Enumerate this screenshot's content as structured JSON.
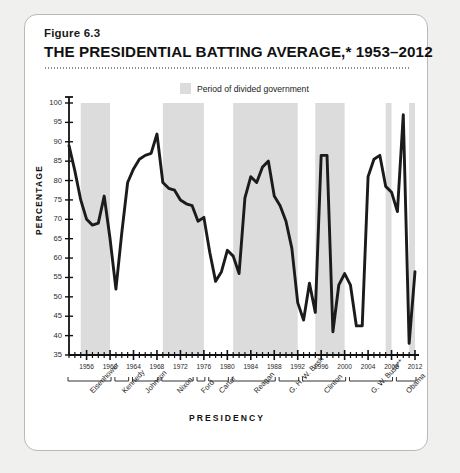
{
  "figure": {
    "number": "Figure 6.3",
    "title": "THE PRESIDENTIAL BATTING AVERAGE,* 1953–2012"
  },
  "legend": {
    "label": "Period of divided government",
    "swatch_color": "#dcdcdc"
  },
  "axes": {
    "y_title": "PERCENTAGE",
    "x_title": "PRESIDENCY",
    "y_ticks": [
      "100",
      "95",
      "90",
      "85",
      "80",
      "75",
      "70",
      "65",
      "60",
      "55",
      "50",
      "45",
      "40",
      "35"
    ],
    "x_ticks": [
      "1956",
      "1960",
      "1964",
      "1968",
      "1972",
      "1976",
      "1980",
      "1984",
      "1988",
      "1992",
      "1996",
      "2000",
      "2004",
      "2008",
      "2012"
    ]
  },
  "presidents": [
    {
      "name": "Eisenhower",
      "start": 1953,
      "end": 1960
    },
    {
      "name": "Kennedy",
      "start": 1961,
      "end": 1963
    },
    {
      "name": "Johnson",
      "start": 1964,
      "end": 1968
    },
    {
      "name": "Nixon",
      "start": 1969,
      "end": 1974
    },
    {
      "name": "Ford",
      "start": 1975,
      "end": 1976
    },
    {
      "name": "Carter",
      "start": 1977,
      "end": 1980
    },
    {
      "name": "Reagan",
      "start": 1981,
      "end": 1988
    },
    {
      "name": "G. H. W. Bush",
      "start": 1989,
      "end": 1992
    },
    {
      "name": "Clinton",
      "start": 1993,
      "end": 2000
    },
    {
      "name": "G. W. Bush**",
      "start": 2001,
      "end": 2008
    },
    {
      "name": "Obama",
      "start": 2009,
      "end": 2012
    }
  ],
  "chart_data": {
    "type": "line",
    "title": "THE PRESIDENTIAL BATTING AVERAGE,* 1953–2012",
    "xlabel": "PRESIDENCY",
    "ylabel": "PERCENTAGE",
    "xlim": [
      1953,
      2012
    ],
    "ylim": [
      35,
      100
    ],
    "grid": false,
    "legend_position": "top-center",
    "line_color": "#1b1b1b",
    "series_name": "Presidential batting average",
    "x": [
      1953,
      1954,
      1955,
      1956,
      1957,
      1958,
      1959,
      1960,
      1961,
      1962,
      1963,
      1964,
      1965,
      1966,
      1967,
      1968,
      1969,
      1970,
      1971,
      1972,
      1973,
      1974,
      1975,
      1976,
      1977,
      1978,
      1979,
      1980,
      1981,
      1982,
      1983,
      1984,
      1985,
      1986,
      1987,
      1988,
      1989,
      1990,
      1991,
      1992,
      1993,
      1994,
      1995,
      1996,
      1997,
      1998,
      1999,
      2000,
      2001,
      2002,
      2003,
      2004,
      2005,
      2006,
      2007,
      2008,
      2009,
      2010,
      2011,
      2012
    ],
    "y": [
      89.0,
      82.5,
      75.0,
      70.0,
      68.5,
      69.0,
      76.0,
      65.0,
      52.0,
      66.5,
      79.5,
      83.0,
      85.5,
      86.5,
      87.0,
      92.0,
      79.5,
      78.0,
      77.5,
      75.0,
      74.0,
      73.5,
      69.5,
      70.5,
      61.5,
      54.0,
      56.5,
      62.0,
      60.5,
      56.0,
      75.5,
      81.0,
      79.5,
      83.5,
      85.0,
      76.0,
      73.5,
      69.5,
      62.5,
      48.5,
      44.0,
      53.5,
      46.0,
      86.5,
      86.5,
      41.0,
      53.0,
      56.0,
      53.0,
      42.5,
      42.5,
      81.0,
      85.5,
      86.5,
      78.5,
      77.0,
      72.0,
      97.0,
      38.0,
      56.5,
      51.0
    ],
    "shaded_bands": [
      {
        "label": "Period of divided government",
        "start": 1955,
        "end": 1960
      },
      {
        "label": "Period of divided government",
        "start": 1969,
        "end": 1976
      },
      {
        "label": "Period of divided government",
        "start": 1981,
        "end": 1992
      },
      {
        "label": "Period of divided government",
        "start": 1995,
        "end": 2000
      },
      {
        "label": "Period of divided government",
        "start": 2007,
        "end": 2008
      },
      {
        "label": "Period of divided government",
        "start": 2011,
        "end": 2012
      }
    ],
    "band_color": "#dcdcdc"
  }
}
